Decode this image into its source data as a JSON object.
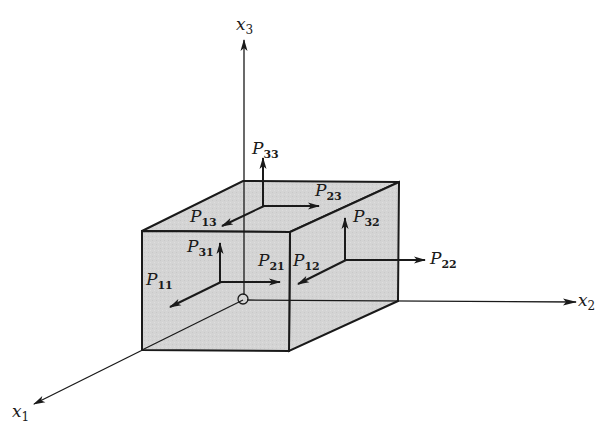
{
  "figure": {
    "colors": {
      "background": "#ffffff",
      "box_fill": "#d4d4d4",
      "box_edge": "#1a1a1a",
      "axis": "#1a1a1a",
      "text": "#1a1a1a"
    }
  },
  "axes": {
    "x1": {
      "base": "x",
      "sub": "1"
    },
    "x2": {
      "base": "x",
      "sub": "2"
    },
    "x3": {
      "base": "x",
      "sub": "3"
    }
  },
  "components": {
    "P11": {
      "base": "P",
      "sub": "11",
      "face": "front"
    },
    "P21": {
      "base": "P",
      "sub": "21",
      "face": "front"
    },
    "P31": {
      "base": "P",
      "sub": "31",
      "face": "front"
    },
    "P12": {
      "base": "P",
      "sub": "12",
      "face": "right"
    },
    "P22": {
      "base": "P",
      "sub": "22",
      "face": "right"
    },
    "P32": {
      "base": "P",
      "sub": "32",
      "face": "right"
    },
    "P13": {
      "base": "P",
      "sub": "13",
      "face": "top"
    },
    "P23": {
      "base": "P",
      "sub": "23",
      "face": "top"
    },
    "P33": {
      "base": "P",
      "sub": "33",
      "face": "top"
    }
  }
}
